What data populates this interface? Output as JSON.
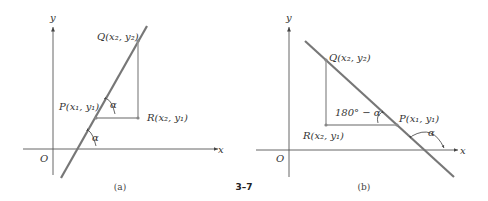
{
  "figure_number": "3–7",
  "panels": [
    {
      "id": "a",
      "caption": "(a)",
      "axis_x_label": "x",
      "axis_y_label": "y",
      "origin_label": "O",
      "points": {
        "P": "P(x₁, y₁)",
        "Q": "Q(x₂, y₂)",
        "R": "R(x₂, y₁)"
      },
      "angle_labels": [
        "α",
        "α"
      ],
      "line_slope": "positive"
    },
    {
      "id": "b",
      "caption": "(b)",
      "axis_x_label": "x",
      "axis_y_label": "y",
      "origin_label": "O",
      "points": {
        "P": "P(x₁, y₁)",
        "Q": "Q(x₂, y₂)",
        "R": "R(x₂, y₁)"
      },
      "angle_labels": [
        "180° − α",
        "α"
      ],
      "line_slope": "negative"
    }
  ]
}
